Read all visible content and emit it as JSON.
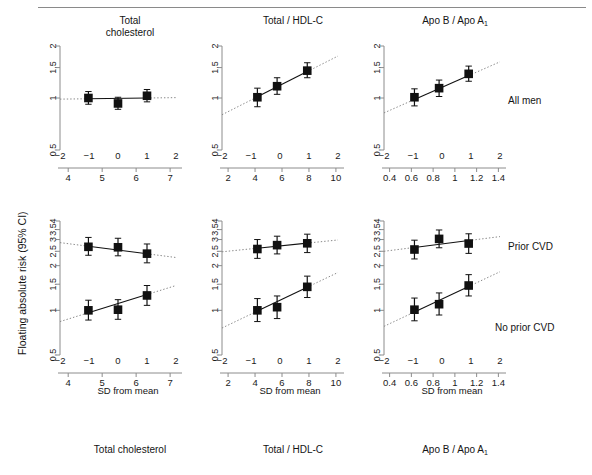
{
  "figure": {
    "ylabel": "Floating absolute risk (95% CI)",
    "sd_axis_label": "SD from mean",
    "column_titles": [
      {
        "line1": "Total",
        "line2": "cholesterol"
      },
      {
        "line1": "Total / HDL-C",
        "line2": ""
      },
      {
        "line1": "Apo B / Apo A",
        "line2": "",
        "sub": "1"
      }
    ],
    "row_labels": [
      "All men",
      "Prior CVD",
      "No prior CVD"
    ],
    "bottom_labels": [
      "Total cholesterol",
      "Total / HDL-C",
      "Apo B / Apo A"
    ],
    "bottom_label_sub": "1"
  },
  "chart_data": {
    "type": "scatter",
    "ylabel": "Floating absolute risk (95% CI)",
    "xlabel": "SD from mean",
    "y_scale": "log",
    "panels": [
      {
        "id": "top-total-cholesterol",
        "row": "All men",
        "column": "Total cholesterol",
        "ylim": [
          0.5,
          2
        ],
        "yticks": [
          0.5,
          1,
          1.5,
          2
        ],
        "x_primary_label": "SD from mean",
        "x_primary_lim": [
          -2,
          2
        ],
        "x_primary_ticks": [
          -2,
          -1,
          0,
          1,
          2
        ],
        "x_secondary_lim": [
          3.7,
          7.35
        ],
        "x_secondary_ticks": [
          4,
          5,
          6,
          7
        ],
        "points": [
          {
            "x": -1.02,
            "y": 1.0,
            "lo": 0.92,
            "hi": 1.09
          },
          {
            "x": 0.0,
            "y": 0.93,
            "lo": 0.86,
            "hi": 1.01
          },
          {
            "x": 1.0,
            "y": 1.03,
            "lo": 0.95,
            "hi": 1.12
          }
        ],
        "fit_line": {
          "x0": -2,
          "y0": 0.985,
          "x1": 2,
          "y1": 1.005
        },
        "solid_span": [
          -1.02,
          1.0
        ]
      },
      {
        "id": "top-total-hdl",
        "row": "All men",
        "column": "Total / HDL-C",
        "ylim": [
          0.5,
          2
        ],
        "yticks": [
          0.5,
          1,
          1.5,
          2
        ],
        "x_primary_lim": [
          -2,
          2
        ],
        "x_primary_ticks": [
          -2,
          -1,
          0,
          1,
          2
        ],
        "x_secondary_lim": [
          1.4,
          10.6
        ],
        "x_secondary_ticks": [
          2,
          4,
          6,
          8,
          10
        ],
        "points": [
          {
            "x": -0.78,
            "y": 1.01,
            "lo": 0.89,
            "hi": 1.14
          },
          {
            "x": -0.1,
            "y": 1.17,
            "lo": 1.05,
            "hi": 1.31
          },
          {
            "x": 0.94,
            "y": 1.44,
            "lo": 1.31,
            "hi": 1.6
          }
        ],
        "fit_line": {
          "x0": -2,
          "y0": 0.8,
          "x1": 2,
          "y1": 1.75
        },
        "solid_span": [
          -0.78,
          0.94
        ]
      },
      {
        "id": "top-apo",
        "row": "All men",
        "column": "Apo B / Apo A1",
        "ylim": [
          0.5,
          2
        ],
        "yticks": [
          0.5,
          1,
          1.5,
          2
        ],
        "x_primary_lim": [
          -2,
          2
        ],
        "x_primary_ticks": [
          -2,
          -1,
          0,
          1,
          2
        ],
        "x_secondary_lim": [
          0.33,
          1.47
        ],
        "x_secondary_ticks": [
          0.4,
          0.6,
          0.8,
          1,
          1.2,
          1.4
        ],
        "points": [
          {
            "x": -0.95,
            "y": 1.01,
            "lo": 0.9,
            "hi": 1.13
          },
          {
            "x": -0.1,
            "y": 1.14,
            "lo": 1.02,
            "hi": 1.27
          },
          {
            "x": 0.92,
            "y": 1.38,
            "lo": 1.25,
            "hi": 1.53
          }
        ],
        "fit_line": {
          "x0": -2,
          "y0": 0.82,
          "x1": 2,
          "y1": 1.62
        },
        "solid_span": [
          -0.95,
          0.92
        ]
      },
      {
        "id": "bot-total-cholesterol",
        "row": "Prior CVD / No prior CVD",
        "column": "Total cholesterol",
        "ylim": [
          0.5,
          4
        ],
        "yticks": [
          0.5,
          1,
          1.5,
          2,
          2.5,
          3,
          3.5,
          4
        ],
        "x_primary_lim": [
          -2,
          2
        ],
        "x_primary_ticks": [
          -2,
          -1,
          0,
          1,
          2
        ],
        "x_secondary_lim": [
          3.7,
          7.35
        ],
        "x_secondary_ticks": [
          4,
          5,
          6,
          7
        ],
        "series": [
          {
            "name": "Prior CVD",
            "points": [
              {
                "x": -1.02,
                "y": 2.68,
                "lo": 2.35,
                "hi": 3.1
              },
              {
                "x": 0.0,
                "y": 2.66,
                "lo": 2.33,
                "hi": 3.06
              },
              {
                "x": 1.0,
                "y": 2.41,
                "lo": 2.09,
                "hi": 2.8
              }
            ],
            "fit_line": {
              "x0": -2,
              "y0": 2.86,
              "x1": 2,
              "y1": 2.27
            },
            "solid_span": [
              -1.02,
              1.0
            ]
          },
          {
            "name": "No prior CVD",
            "points": [
              {
                "x": -1.02,
                "y": 1.0,
                "lo": 0.86,
                "hi": 1.17
              },
              {
                "x": 0.0,
                "y": 1.01,
                "lo": 0.87,
                "hi": 1.18
              },
              {
                "x": 1.0,
                "y": 1.26,
                "lo": 1.08,
                "hi": 1.47
              }
            ],
            "fit_line": {
              "x0": -2,
              "y0": 0.84,
              "x1": 2,
              "y1": 1.47
            },
            "solid_span": [
              -1.02,
              1.0
            ]
          }
        ]
      },
      {
        "id": "bot-total-hdl",
        "row": "Prior CVD / No prior CVD",
        "column": "Total / HDL-C",
        "ylim": [
          0.5,
          4
        ],
        "yticks": [
          0.5,
          1,
          1.5,
          2,
          2.5,
          3,
          3.5,
          4
        ],
        "x_primary_lim": [
          -2,
          2
        ],
        "x_primary_ticks": [
          -2,
          -1,
          0,
          1,
          2
        ],
        "x_secondary_lim": [
          1.4,
          10.6
        ],
        "x_secondary_ticks": [
          2,
          4,
          6,
          8,
          10
        ],
        "series": [
          {
            "name": "Prior CVD",
            "points": [
              {
                "x": -0.78,
                "y": 2.59,
                "lo": 2.24,
                "hi": 3.0
              },
              {
                "x": -0.1,
                "y": 2.75,
                "lo": 2.4,
                "hi": 3.16
              },
              {
                "x": 0.94,
                "y": 2.83,
                "lo": 2.45,
                "hi": 3.26
              }
            ],
            "fit_line": {
              "x0": -2,
              "y0": 2.48,
              "x1": 2,
              "y1": 2.98
            },
            "solid_span": [
              -0.78,
              0.94
            ]
          },
          {
            "name": "No prior CVD",
            "points": [
              {
                "x": -0.78,
                "y": 1.0,
                "lo": 0.84,
                "hi": 1.2
              },
              {
                "x": -0.1,
                "y": 1.05,
                "lo": 0.88,
                "hi": 1.25
              },
              {
                "x": 0.94,
                "y": 1.44,
                "lo": 1.22,
                "hi": 1.7
              }
            ],
            "fit_line": {
              "x0": -2,
              "y0": 0.76,
              "x1": 2,
              "y1": 1.8
            },
            "solid_span": [
              -0.78,
              0.94
            ]
          }
        ]
      },
      {
        "id": "bot-apo",
        "row": "Prior CVD / No prior CVD",
        "column": "Apo B / Apo A1",
        "ylim": [
          0.5,
          4
        ],
        "yticks": [
          0.5,
          1,
          1.5,
          2,
          2.5,
          3,
          3.5,
          4
        ],
        "x_primary_lim": [
          -2,
          2
        ],
        "x_primary_ticks": [
          -2,
          -1,
          0,
          1,
          2
        ],
        "x_secondary_lim": [
          0.33,
          1.47
        ],
        "x_secondary_ticks": [
          0.4,
          0.6,
          0.8,
          1,
          1.2,
          1.4
        ],
        "series": [
          {
            "name": "Prior CVD",
            "points": [
              {
                "x": -0.95,
                "y": 2.57,
                "lo": 2.22,
                "hi": 2.97
              },
              {
                "x": -0.1,
                "y": 3.03,
                "lo": 2.64,
                "hi": 3.48
              },
              {
                "x": 0.92,
                "y": 2.82,
                "lo": 2.42,
                "hi": 3.28
              }
            ],
            "fit_line": {
              "x0": -2,
              "y0": 2.5,
              "x1": 2,
              "y1": 3.14
            },
            "solid_span": [
              -0.95,
              0.92
            ]
          },
          {
            "name": "No prior CVD",
            "points": [
              {
                "x": -0.95,
                "y": 1.01,
                "lo": 0.85,
                "hi": 1.21
              },
              {
                "x": -0.1,
                "y": 1.1,
                "lo": 0.93,
                "hi": 1.31
              },
              {
                "x": 0.92,
                "y": 1.47,
                "lo": 1.25,
                "hi": 1.74
              }
            ],
            "fit_line": {
              "x0": -2,
              "y0": 0.78,
              "x1": 2,
              "y1": 1.82
            },
            "solid_span": [
              -0.95,
              0.92
            ]
          }
        ]
      }
    ]
  }
}
